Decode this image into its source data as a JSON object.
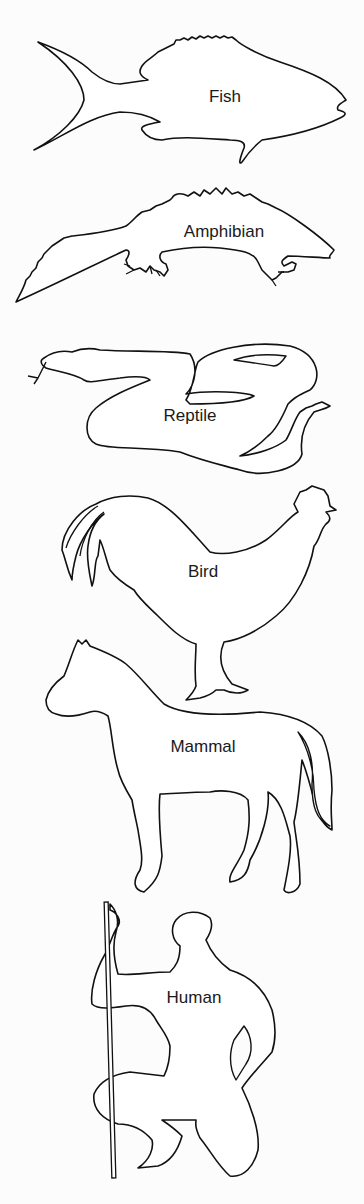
{
  "diagram": {
    "type": "vertebrate-silhouettes",
    "colors": {
      "outline": "#111111",
      "background": "#fcfcfc",
      "text": "#1a1a1a"
    },
    "animals": [
      {
        "id": "fish",
        "label": "Fish"
      },
      {
        "id": "amphibian",
        "label": "Amphibian"
      },
      {
        "id": "reptile",
        "label": "Reptile"
      },
      {
        "id": "bird",
        "label": "Bird"
      },
      {
        "id": "mammal",
        "label": "Mammal"
      },
      {
        "id": "human",
        "label": "Human"
      }
    ]
  }
}
